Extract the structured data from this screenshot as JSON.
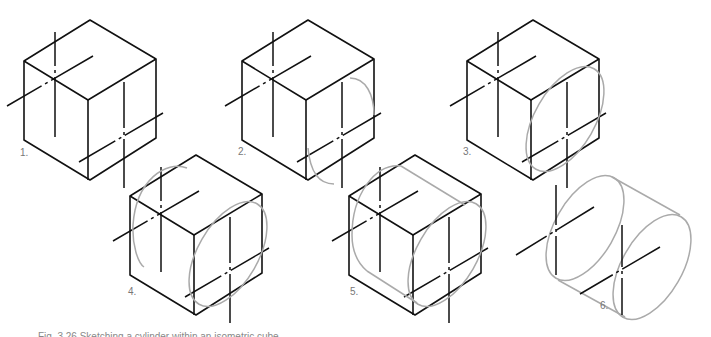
{
  "figure": {
    "steps": [
      {
        "label": "1.",
        "description": "Isometric cube with center lines on faces"
      },
      {
        "label": "2.",
        "description": "Partial arcs sketched on right face"
      },
      {
        "label": "3.",
        "description": "Complete ellipse on right face"
      },
      {
        "label": "4.",
        "description": "Back ellipse partly sketched"
      },
      {
        "label": "5.",
        "description": "Tangent lines joining the ellipses"
      },
      {
        "label": "6.",
        "description": "Finished cylinder with center lines"
      }
    ],
    "caption": "Fig. 3.26 Sketching a cylinder within an isometric cube",
    "colors": {
      "line": "#111111",
      "construction": "#aaaaaa",
      "label": "#777777"
    }
  }
}
